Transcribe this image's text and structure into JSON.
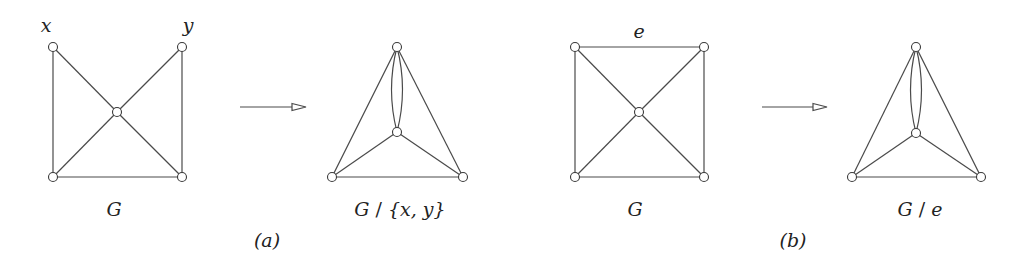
{
  "figure": {
    "panel_a": {
      "caption": "(a)",
      "original": {
        "name": "G",
        "vertex_labels": {
          "x": "x",
          "y": "y"
        },
        "vertices": [
          {
            "id": "x",
            "cx": 53,
            "cy": 47
          },
          {
            "id": "y",
            "cx": 182,
            "cy": 47
          },
          {
            "id": "c",
            "cx": 117,
            "cy": 112
          },
          {
            "id": "bl",
            "cx": 53,
            "cy": 177
          },
          {
            "id": "br",
            "cx": 182,
            "cy": 177
          }
        ],
        "edges": [
          [
            "x",
            "bl"
          ],
          [
            "x",
            "c"
          ],
          [
            "y",
            "c"
          ],
          [
            "y",
            "br"
          ],
          [
            "c",
            "bl"
          ],
          [
            "c",
            "br"
          ],
          [
            "bl",
            "br"
          ]
        ]
      },
      "contracted": {
        "name": "G / {x, y}",
        "name_parts": {
          "g": "G",
          "slash": " / ",
          "set": "{x, y}"
        },
        "vertices": [
          {
            "id": "xy",
            "cx": 397,
            "cy": 47
          },
          {
            "id": "c",
            "cx": 397,
            "cy": 132
          },
          {
            "id": "bl",
            "cx": 332,
            "cy": 177
          },
          {
            "id": "br",
            "cx": 463,
            "cy": 177
          }
        ],
        "edges": [
          [
            "xy",
            "bl"
          ],
          [
            "xy",
            "br"
          ],
          [
            "c",
            "bl"
          ],
          [
            "c",
            "br"
          ],
          [
            "bl",
            "br"
          ]
        ],
        "parallel_edges": [
          [
            "xy",
            "c",
            2
          ]
        ]
      },
      "arrow": {
        "x1": 240,
        "x2": 306,
        "y": 107
      }
    },
    "panel_b": {
      "caption": "(b)",
      "original": {
        "name": "G",
        "edge_label": "e",
        "vertices": [
          {
            "id": "tl",
            "cx": 575,
            "cy": 47
          },
          {
            "id": "tr",
            "cx": 704,
            "cy": 47
          },
          {
            "id": "c",
            "cx": 639,
            "cy": 112
          },
          {
            "id": "bl",
            "cx": 575,
            "cy": 177
          },
          {
            "id": "br",
            "cx": 704,
            "cy": 177
          }
        ],
        "edges": [
          [
            "tl",
            "tr"
          ],
          [
            "tl",
            "bl"
          ],
          [
            "tl",
            "c"
          ],
          [
            "tr",
            "c"
          ],
          [
            "tr",
            "br"
          ],
          [
            "c",
            "bl"
          ],
          [
            "c",
            "br"
          ],
          [
            "bl",
            "br"
          ]
        ]
      },
      "contracted": {
        "name": "G / e",
        "name_parts": {
          "g": "G",
          "slash": " / ",
          "e": "e"
        },
        "vertices": [
          {
            "id": "e",
            "cx": 916,
            "cy": 47
          },
          {
            "id": "c",
            "cx": 916,
            "cy": 133
          },
          {
            "id": "bl",
            "cx": 852,
            "cy": 177
          },
          {
            "id": "br",
            "cx": 981,
            "cy": 177
          }
        ],
        "edges": [
          [
            "e",
            "bl"
          ],
          [
            "e",
            "br"
          ],
          [
            "c",
            "bl"
          ],
          [
            "c",
            "br"
          ],
          [
            "bl",
            "br"
          ]
        ],
        "parallel_edges": [
          [
            "e",
            "c",
            2
          ]
        ]
      },
      "arrow": {
        "x1": 762,
        "x2": 827,
        "y": 107
      }
    },
    "colors": {
      "stroke": "#4a4a4a",
      "vertex_fill": "#ffffff",
      "text": "#222222"
    }
  }
}
